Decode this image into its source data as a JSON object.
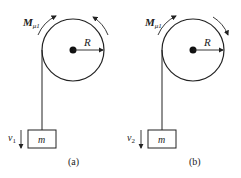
{
  "figure": {
    "panels": [
      {
        "id": "a",
        "caption": "(a)",
        "moment_label": "M",
        "moment_sub": "μ1",
        "radius_label": "R",
        "mass_label": "m",
        "velocity_label": "v",
        "velocity_sub": "1",
        "right_arc_direction": "counterclockwise"
      },
      {
        "id": "b",
        "caption": "(b)",
        "moment_label": "M",
        "moment_sub": "μ1",
        "radius_label": "R",
        "mass_label": "m",
        "velocity_label": "v",
        "velocity_sub": "2",
        "right_arc_direction": "clockwise"
      }
    ],
    "colors": {
      "line": "#222222",
      "background": "#ffffff"
    }
  }
}
